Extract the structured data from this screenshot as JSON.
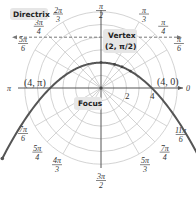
{
  "chart_data": {
    "type": "line",
    "title": "",
    "coordinate_system": "polar",
    "equation": "r = 4 / (1 + sin θ)",
    "grid": {
      "rings": [
        1,
        2,
        3,
        4,
        5,
        6
      ],
      "spokes_deg": [
        0,
        30,
        45,
        60,
        90,
        120,
        135,
        150,
        180,
        210,
        225,
        240,
        270,
        300,
        315,
        330
      ]
    },
    "angle_labels": [
      {
        "deg": 0,
        "label": "0"
      },
      {
        "deg": 30,
        "num": "π",
        "den": "6"
      },
      {
        "deg": 45,
        "num": "π",
        "den": "4"
      },
      {
        "deg": 60,
        "num": "π",
        "den": "3"
      },
      {
        "deg": 90,
        "num": "π",
        "den": "2"
      },
      {
        "deg": 120,
        "num": "2π",
        "den": "3"
      },
      {
        "deg": 135,
        "num": "3π",
        "den": "4"
      },
      {
        "deg": 150,
        "num": "5π",
        "den": "6"
      },
      {
        "deg": 180,
        "label": "π"
      },
      {
        "deg": 210,
        "num": "7π",
        "den": "6"
      },
      {
        "deg": 225,
        "num": "5π",
        "den": "4"
      },
      {
        "deg": 240,
        "num": "4π",
        "den": "3"
      },
      {
        "deg": 270,
        "num": "3π",
        "den": "2"
      },
      {
        "deg": 300,
        "num": "5π",
        "den": "3"
      },
      {
        "deg": 315,
        "num": "7π",
        "den": "4"
      },
      {
        "deg": 330,
        "num": "11π",
        "den": "6"
      }
    ],
    "radial_tick_labels": [
      {
        "r": 2,
        "label": "2"
      },
      {
        "r": 4,
        "label": "4"
      }
    ],
    "points": [
      {
        "r": 4,
        "theta": "π",
        "label": "(4, π)"
      },
      {
        "r": 4,
        "theta": "0",
        "label": "(4, 0)"
      },
      {
        "r": 2,
        "theta": "π/2",
        "label": "Vertex (2, π/2)"
      }
    ],
    "directrix": {
      "type": "horizontal",
      "y": 4
    },
    "focus": {
      "x": 0,
      "y": 0
    }
  },
  "labels": {
    "directrix": "Directrix",
    "vertex_line1": "Vertex",
    "vertex_line2": "(2, π/2)",
    "focus": "Focus",
    "pt_left": "(4, π)",
    "pt_right": "(4, 0)",
    "num_2": "2",
    "num_4": "4"
  },
  "style": {
    "curve_color": "#555555",
    "grid_color": "#c8c8c8",
    "callout_bg": "#e6e6e6"
  }
}
